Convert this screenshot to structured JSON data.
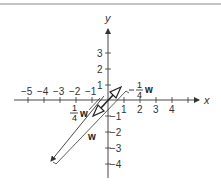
{
  "diagram": {
    "x_axis_label": "x",
    "y_axis_label": "y",
    "x_ticks": [
      {
        "value": -5,
        "label": "−5"
      },
      {
        "value": -4,
        "label": "−4"
      },
      {
        "value": -3,
        "label": "−3"
      },
      {
        "value": -2,
        "label": "−2"
      },
      {
        "value": -1,
        "label": "−1"
      },
      {
        "value": 1,
        "label": "1"
      },
      {
        "value": 2,
        "label": "2"
      },
      {
        "value": 3,
        "label": "3"
      },
      {
        "value": 4,
        "label": "4"
      }
    ],
    "y_ticks": [
      {
        "value": 3,
        "label": "3"
      },
      {
        "value": 2,
        "label": "2"
      },
      {
        "value": 1,
        "label": "1"
      },
      {
        "value": -1,
        "label": "−1"
      },
      {
        "value": -2,
        "label": "−2"
      },
      {
        "value": -3,
        "label": "−3"
      },
      {
        "value": -4,
        "label": "−4"
      }
    ],
    "vectors": {
      "w": {
        "label": "w"
      },
      "quarter_w": {
        "sign": "",
        "numerator": "1",
        "denominator": "4",
        "symbol": "w"
      },
      "neg_quarter_w": {
        "sign": "−",
        "numerator": "1",
        "denominator": "4",
        "symbol": "w"
      }
    },
    "colors": {
      "stroke": "#333333",
      "background": "#ffffff"
    }
  }
}
